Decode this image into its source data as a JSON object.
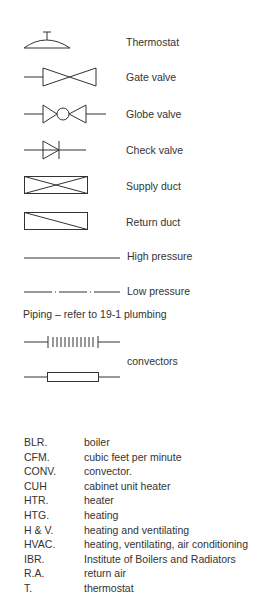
{
  "legend": [
    {
      "symbol": "thermostat-icon",
      "label": "Thermostat"
    },
    {
      "symbol": "gate-valve-icon",
      "label": "Gate valve"
    },
    {
      "symbol": "globe-valve-icon",
      "label": "Globe valve"
    },
    {
      "symbol": "check-valve-icon",
      "label": "Check valve"
    },
    {
      "symbol": "supply-duct-icon",
      "label": "Supply duct"
    },
    {
      "symbol": "return-duct-icon",
      "label": "Return duct"
    },
    {
      "symbol": "high-pressure-line-icon",
      "label": "High pressure"
    },
    {
      "symbol": "low-pressure-line-icon",
      "label": "Low pressure"
    }
  ],
  "piping_note": "Piping – refer to 19-1 plumbing",
  "convectors_label": "convectors",
  "abbreviations": [
    {
      "abbr": "BLR.",
      "meaning": "boiler"
    },
    {
      "abbr": "CFM.",
      "meaning": "cubic feet per minute"
    },
    {
      "abbr": "CONV.",
      "meaning": "convector."
    },
    {
      "abbr": "CUH",
      "meaning": "cabinet unit heater"
    },
    {
      "abbr": "HTR.",
      "meaning": "heater"
    },
    {
      "abbr": "HTG.",
      "meaning": "heating"
    },
    {
      "abbr": "H & V.",
      "meaning": "heating and ventilating"
    },
    {
      "abbr": "HVAC.",
      "meaning": "heating, ventilating, air conditioning"
    },
    {
      "abbr": "IBR.",
      "meaning": "Institute of Boilers and Radiators"
    },
    {
      "abbr": "R.A.",
      "meaning": "return air"
    },
    {
      "abbr": "T.",
      "meaning": "thermostat"
    }
  ]
}
